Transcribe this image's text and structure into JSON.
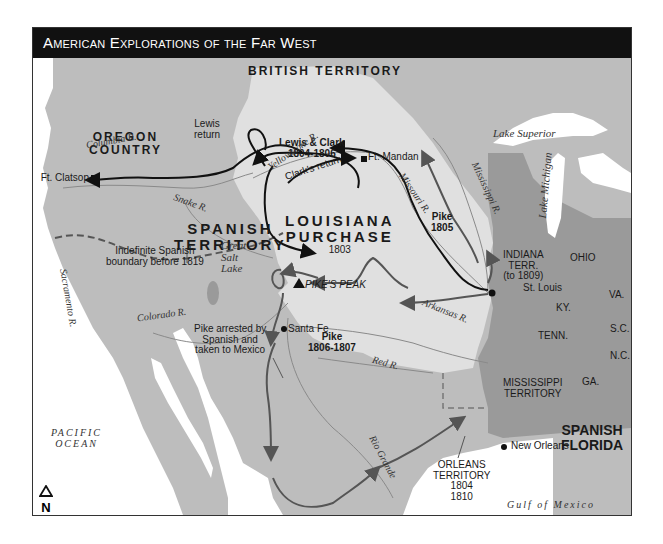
{
  "title": "American Explorations of the Far West",
  "colors": {
    "title_bar": "#111111",
    "water": "#ffffff",
    "foreign_land": "#bdbdbd",
    "louisiana_purchase": "#e0e0e0",
    "us_states": "#9a9a9a",
    "route_lewis_clark": "#111111",
    "route_pike": "#555555"
  },
  "regions": {
    "british": "BRITISH TERRITORY",
    "oregon": [
      "OREGON",
      "COUNTRY"
    ],
    "spanish": [
      "SPANISH",
      "TERRITORY"
    ],
    "louisiana": [
      "LOUISIANA",
      "PURCHASE"
    ],
    "louisiana_year": "1803",
    "spanish_florida": [
      "SPANISH",
      "FLORIDA"
    ],
    "indiana": [
      "INDIANA",
      "TERR.",
      "(to 1809)"
    ],
    "mississippi": [
      "MISSISSIPPI",
      "TERRITORY"
    ],
    "orleans": [
      "ORLEANS",
      "TERRITORY",
      "1804",
      "1810"
    ]
  },
  "states": [
    "OHIO",
    "KY.",
    "VA.",
    "TENN.",
    "S.C.",
    "N.C.",
    "GA."
  ],
  "places": {
    "ft_clatsop": "Ft. Clatsop",
    "ft_mandan": "Ft. Mandan",
    "st_louis": "St. Louis",
    "santa_fe": "Santa Fe",
    "new_orleans": "New Orleans",
    "pikes_peak": "PIKE'S PEAK"
  },
  "routes": {
    "lewis_clark": [
      "Lewis & Clark",
      "1804-1806"
    ],
    "lewis_return": [
      "Lewis",
      "return"
    ],
    "clark_return": "Clark's return",
    "pike_1805": [
      "Pike",
      "1805"
    ],
    "pike_1806": [
      "Pike",
      "1806-1807"
    ]
  },
  "annotations": {
    "spanish_boundary": [
      "Indefinite Spanish",
      "boundary before 1819"
    ],
    "pike_arrested": [
      "Pike arrested by",
      "Spanish and",
      "taken to Mexico"
    ]
  },
  "rivers": {
    "columbia": "Columbia R.",
    "snake": "Snake R.",
    "sacramento": "Sacramento R.",
    "yellowstone": "Yellowstone R.",
    "missouri": "Missouri R.",
    "mississippi": "Mississippi R.",
    "colorado": "Colorado R.",
    "arkansas": "Arkansas R.",
    "red": "Red R.",
    "rio_grande": "Rio Grande"
  },
  "water_bodies": {
    "pacific": [
      "PACIFIC",
      "OCEAN"
    ],
    "gulf": "Gulf of Mexico",
    "lake_superior": "Lake Superior",
    "lake_michigan": "Lake Michigan",
    "great_salt_lake": [
      "Great",
      "Salt",
      "Lake"
    ]
  },
  "compass": "N"
}
